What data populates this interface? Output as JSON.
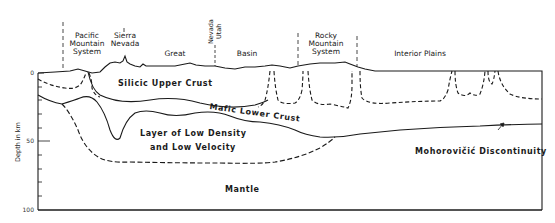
{
  "diagram": {
    "type": "geologic-cross-section",
    "y_axis": {
      "label": "Depth in km",
      "ticks": [
        "0",
        "50",
        "100"
      ]
    },
    "regions": [
      {
        "id": "pacific",
        "label_lines": [
          "Pacific",
          "Mountain",
          "System"
        ]
      },
      {
        "id": "sierra",
        "label_lines": [
          "Sierra",
          "Nevada"
        ]
      },
      {
        "id": "great",
        "label": "Great"
      },
      {
        "id": "nevada-utah",
        "label_lines": [
          "Nevada",
          "Utah"
        ]
      },
      {
        "id": "basin",
        "label": "Basin"
      },
      {
        "id": "rocky",
        "label_lines": [
          "Rocky",
          "Mountain",
          "System"
        ]
      },
      {
        "id": "interior",
        "label": "Interior Plains"
      }
    ],
    "layers": {
      "upper_crust": "Silicic Upper Crust",
      "lower_crust": "Mafic Lower Crust",
      "low_density_1": "Layer of Low Density",
      "low_density_2": "and Low Velocity",
      "mantle": "Mantle",
      "moho": "Mohorovičić Discontinuity"
    },
    "colors": {
      "ink": "#1a1a1a",
      "background": "#ffffff"
    }
  }
}
